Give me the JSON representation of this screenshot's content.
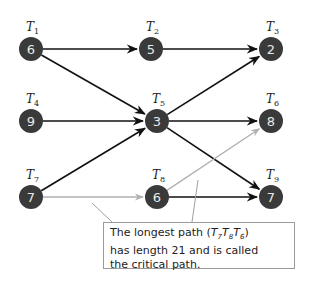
{
  "diagram": {
    "type": "activity-network",
    "nodes": [
      {
        "id": "T1",
        "label": "T",
        "sub": "1",
        "value": "6",
        "x": 31,
        "y": 49
      },
      {
        "id": "T2",
        "label": "T",
        "sub": "2",
        "value": "5",
        "x": 151,
        "y": 49
      },
      {
        "id": "T3",
        "label": "T",
        "sub": "3",
        "value": "2",
        "x": 271,
        "y": 49
      },
      {
        "id": "T4",
        "label": "T",
        "sub": "4",
        "value": "9",
        "x": 31,
        "y": 121
      },
      {
        "id": "T5",
        "label": "T",
        "sub": "5",
        "value": "3",
        "x": 157,
        "y": 121
      },
      {
        "id": "T6",
        "label": "T",
        "sub": "6",
        "value": "8",
        "x": 271,
        "y": 121
      },
      {
        "id": "T7",
        "label": "T",
        "sub": "7",
        "value": "7",
        "x": 31,
        "y": 197
      },
      {
        "id": "T8",
        "label": "T",
        "sub": "8",
        "value": "6",
        "x": 157,
        "y": 197
      },
      {
        "id": "T9",
        "label": "T",
        "sub": "9",
        "value": "7",
        "x": 271,
        "y": 197
      }
    ],
    "edges": [
      {
        "from": "T1",
        "to": "T2",
        "critical": false
      },
      {
        "from": "T1",
        "to": "T5",
        "critical": false
      },
      {
        "from": "T2",
        "to": "T3",
        "critical": false
      },
      {
        "from": "T4",
        "to": "T5",
        "critical": false
      },
      {
        "from": "T7",
        "to": "T5",
        "critical": false
      },
      {
        "from": "T5",
        "to": "T3",
        "critical": false
      },
      {
        "from": "T5",
        "to": "T6",
        "critical": false
      },
      {
        "from": "T5",
        "to": "T9",
        "critical": false
      },
      {
        "from": "T7",
        "to": "T8",
        "critical": true
      },
      {
        "from": "T8",
        "to": "T6",
        "critical": true
      },
      {
        "from": "T8",
        "to": "T9",
        "critical": false
      }
    ],
    "colors": {
      "node": "#3a3a3a",
      "node_text": "#e8e8e8",
      "edge": "#111111",
      "critical_edge": "#b0b0b0"
    },
    "callout": {
      "line1_pre": "The longest path (",
      "path_nodes": [
        {
          "t": "T",
          "s": "7"
        },
        {
          "t": "T",
          "s": "8"
        },
        {
          "t": "T",
          "s": "6"
        }
      ],
      "line1_post": ")",
      "line2": "has length 21 and is called",
      "line3": "the critical path."
    }
  }
}
